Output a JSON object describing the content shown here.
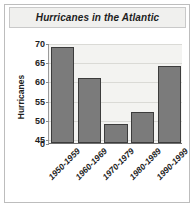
{
  "chart_data": {
    "type": "bar",
    "title": "Hurricanes in the Atlantic",
    "xlabel": "",
    "ylabel": "Hurricanes",
    "categories": [
      "1950-1959",
      "1960-1969",
      "1970-1979",
      "1980-1989",
      "1990-1999"
    ],
    "values": [
      69,
      61,
      49,
      52,
      64
    ],
    "yticks": [
      0,
      45,
      50,
      55,
      60,
      65,
      70
    ],
    "ytick_labels": [
      "0",
      "45",
      "50",
      "55",
      "60",
      "65",
      "70"
    ],
    "ylim": [
      44,
      70
    ],
    "axis_break": true,
    "grid": true,
    "legend": "none",
    "series": [
      {
        "name": "Hurricanes",
        "values": [
          69,
          61,
          49,
          52,
          64
        ]
      }
    ],
    "colors": {
      "bar_fill": "#7b7b7b",
      "bar_border": "#3c3c3c",
      "plot_background": "#f3f3f1",
      "gridline": "#dadad6",
      "text": "#1d1d1d",
      "frame_border": "#bdbdbd",
      "title_background": "#f0f0ee"
    }
  }
}
